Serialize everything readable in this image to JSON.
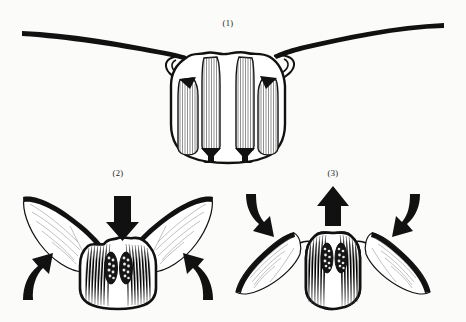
{
  "figure": {
    "background_color": "#fbfbf9",
    "ink_color": "#111111",
    "vein_color": "#8d8d8d",
    "muscle_color": "#4a4a4a",
    "panels": [
      {
        "id": "panel-1",
        "label": "(1)",
        "label_x": 228,
        "label_y": 26,
        "caption": "",
        "description": "Cross-section of thorax with wings spread fully horizontal; vertical striated indirect flight muscles visible inside body wall",
        "wing_state": "outstretched",
        "arrows": []
      },
      {
        "id": "panel-2",
        "label": "(2)",
        "label_x": 118,
        "label_y": 176,
        "caption": "",
        "description": "Wings raised; dorsoventral muscles contract pulling tergum down, wings swing up",
        "wing_state": "up",
        "arrows": [
          {
            "name": "arrow-down-top",
            "type": "straight",
            "direction": "down"
          },
          {
            "name": "arrow-up-left",
            "type": "curved",
            "direction": "up"
          },
          {
            "name": "arrow-up-right",
            "type": "curved",
            "direction": "up"
          }
        ]
      },
      {
        "id": "panel-3",
        "label": "(3)",
        "label_x": 333,
        "label_y": 176,
        "caption": "",
        "description": "Wings lowered; longitudinal muscles contract arching tergum up, wings swing down",
        "wing_state": "down",
        "arrows": [
          {
            "name": "arrow-up-top",
            "type": "straight",
            "direction": "up"
          },
          {
            "name": "arrow-down-left",
            "type": "curved",
            "direction": "down"
          },
          {
            "name": "arrow-down-right",
            "type": "curved",
            "direction": "down"
          }
        ]
      }
    ],
    "muscle_bundles": {
      "panel1_count": 4,
      "panel2_oval_count": 2,
      "panel3_oval_count": 2
    }
  }
}
